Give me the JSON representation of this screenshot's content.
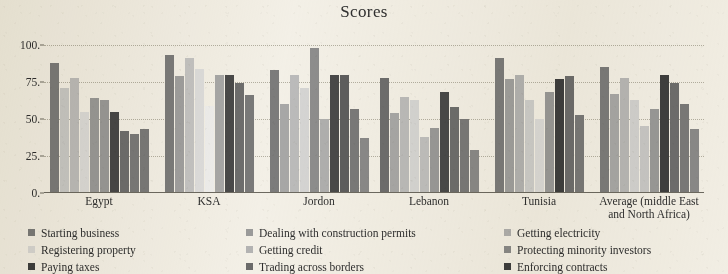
{
  "chart_data": {
    "type": "bar",
    "title": "Scores",
    "xlabel": "",
    "ylabel": "",
    "ylim": [
      0,
      100
    ],
    "yticks": [
      0,
      25,
      50,
      75,
      100
    ],
    "ytick_labels": [
      "0.",
      "25.",
      "50.",
      "75.",
      "100."
    ],
    "grid": true,
    "legend_position": "bottom",
    "legend_columns": 3,
    "categories": [
      "Egypt",
      "KSA",
      "Jordon",
      "Lebanon",
      "Tunisia",
      "Average (middle East and North Africa)"
    ],
    "category_label_lines": [
      [
        "Egypt"
      ],
      [
        "KSA"
      ],
      [
        "Jordon"
      ],
      [
        "Lebanon"
      ],
      [
        "Tunisia"
      ],
      [
        "Average (middle East",
        "and North Africa)"
      ]
    ],
    "series": [
      {
        "name": "Starting business",
        "color": "#7c7c7c",
        "values": [
          88,
          93,
          83,
          0,
          91,
          0
        ]
      },
      {
        "name": "Registering property",
        "color": "#c9c9c9",
        "values": [
          71,
          79,
          60,
          68,
          63,
          85
        ]
      },
      {
        "name": "Paying taxes",
        "color": "#3f3f3f",
        "values": [
          55,
          86,
          98,
          76,
          77,
          98
        ]
      },
      {
        "name": "Dealing with construction permits",
        "color": "#8f8f8f",
        "values": [
          78,
          80,
          71,
          73,
          0,
          68
        ]
      },
      {
        "name": "Getting credit",
        "color": "#d8d8d8",
        "values": [
          55,
          59,
          50,
          72,
          53,
          80
        ]
      },
      {
        "name": "Trading across borders",
        "color": "#6b6b6b",
        "values": [
          64,
          85,
          0,
          41,
          37,
          45
        ]
      },
      {
        "name": "Getting electricity",
        "color": "#a5a5a5",
        "values": [
          63,
          80,
          0,
          48,
          55,
          57
        ]
      },
      {
        "name": "Protecting minority investors",
        "color": "#5a5a5a",
        "values": [
          42,
          74,
          83,
          79,
          74,
          82
        ]
      },
      {
        "name": "Enforcing contracts",
        "color": "#707070",
        "values": [
          40,
          71,
          57,
          68,
          0,
          69
        ]
      }
    ],
    "groups": [
      {
        "category": "Egypt",
        "values": [
          88,
          71,
          78,
          55,
          64,
          63,
          55,
          42,
          40,
          43
        ]
      },
      {
        "category": "KSA",
        "values": [
          93,
          79,
          91,
          59,
          80,
          86,
          74,
          71
        ]
      },
      {
        "category": "Jordon",
        "values": [
          83,
          60,
          80,
          50,
          98,
          71,
          85,
          57,
          37
        ]
      },
      {
        "category": "Lebanon",
        "values": [
          91,
          68,
          73,
          72,
          41,
          48,
          76,
          68,
          57,
          29
        ]
      },
      {
        "category": "Tunisia",
        "values": [
          91,
          77,
          80,
          63,
          53,
          68,
          77,
          74,
          53
        ]
      },
      {
        "category": "Average (middle East and North Africa)",
        "values": [
          85,
          68,
          98,
          80,
          45,
          57,
          82,
          74,
          57
        ]
      }
    ],
    "bars_by_group": [
      {
        "category": "Egypt",
        "bars": [
          {
            "series": "Starting business",
            "value": 88,
            "color": "#7c7c7c"
          },
          {
            "series": "Registering property",
            "value": 71,
            "color": "#c9c9c9"
          },
          {
            "series": "Paying taxes",
            "value": 78,
            "color": "#bdbdbd"
          },
          {
            "series": "Dealing with construction permits",
            "value": 55,
            "color": "#dcdcdc"
          },
          {
            "series": "Getting credit",
            "value": 64,
            "color": "#9a9a9a"
          },
          {
            "series": "Trading across borders",
            "value": 63,
            "color": "#9a9a9a"
          },
          {
            "series": "Getting electricity",
            "value": 55,
            "color": "#484848"
          },
          {
            "series": "Protecting minority investors",
            "value": 42,
            "color": "#6e6e6e"
          },
          {
            "series": "Enforcing contracts",
            "value": 40,
            "color": "#7a7a7a"
          },
          {
            "series": "Enforcing contracts",
            "value": 43,
            "color": "#7a7a7a"
          }
        ]
      },
      {
        "category": "KSA",
        "bars": [
          {
            "series": "Starting business",
            "value": 93,
            "color": "#7c7c7c"
          },
          {
            "series": "Registering property",
            "value": 79,
            "color": "#a0a0a0"
          },
          {
            "series": "Paying taxes",
            "value": 91,
            "color": "#c4c4c4"
          },
          {
            "series": "Dealing with construction permits",
            "value": 84,
            "color": "#dedede"
          },
          {
            "series": "Getting credit",
            "value": 59,
            "color": "#efefef"
          },
          {
            "series": "Trading across borders",
            "value": 80,
            "color": "#a8a8a8"
          },
          {
            "series": "Getting electricity",
            "value": 80,
            "color": "#4a4a4a"
          },
          {
            "series": "Protecting minority investors",
            "value": 74,
            "color": "#6e6e6e"
          },
          {
            "series": "Enforcing contracts",
            "value": 66,
            "color": "#7a7a7a"
          }
        ]
      },
      {
        "category": "Jordon",
        "bars": [
          {
            "series": "Starting business",
            "value": 83,
            "color": "#7c7c7c"
          },
          {
            "series": "Registering property",
            "value": 60,
            "color": "#a8a8a8"
          },
          {
            "series": "Paying taxes",
            "value": 80,
            "color": "#bcbcbc"
          },
          {
            "series": "Dealing with construction permits",
            "value": 71,
            "color": "#d6d6d6"
          },
          {
            "series": "Getting credit",
            "value": 98,
            "color": "#8e8e8e"
          },
          {
            "series": "Trading across borders",
            "value": 50,
            "color": "#b0b0b0"
          },
          {
            "series": "Getting electricity",
            "value": 80,
            "color": "#4a4a4a"
          },
          {
            "series": "Protecting minority investors",
            "value": 80,
            "color": "#5e5e5e"
          },
          {
            "series": "Enforcing contracts",
            "value": 57,
            "color": "#7a7a7a"
          },
          {
            "series": "Enforcing contracts",
            "value": 37,
            "color": "#8a8a8a"
          }
        ]
      },
      {
        "category": "Lebanon",
        "bars": [
          {
            "series": "Starting business",
            "value": 78,
            "color": "#6e6e6e"
          },
          {
            "series": "Registering property",
            "value": 54,
            "color": "#a8a8a8"
          },
          {
            "series": "Paying taxes",
            "value": 65,
            "color": "#bcbcbc"
          },
          {
            "series": "Dealing with construction permits",
            "value": 63,
            "color": "#d6d6d6"
          },
          {
            "series": "Getting credit",
            "value": 38,
            "color": "#c0c0c0"
          },
          {
            "series": "Trading across borders",
            "value": 44,
            "color": "#9a9a9a"
          },
          {
            "series": "Getting electricity",
            "value": 68,
            "color": "#4a4a4a"
          },
          {
            "series": "Protecting minority investors",
            "value": 58,
            "color": "#6e6e6e"
          },
          {
            "series": "Enforcing contracts",
            "value": 50,
            "color": "#7a7a7a"
          },
          {
            "series": "Enforcing contracts",
            "value": 29,
            "color": "#8a8a8a"
          }
        ]
      },
      {
        "category": "Tunisia",
        "bars": [
          {
            "series": "Starting business",
            "value": 91,
            "color": "#7c7c7c"
          },
          {
            "series": "Registering property",
            "value": 77,
            "color": "#a0a0a0"
          },
          {
            "series": "Paying taxes",
            "value": 80,
            "color": "#b4b4b4"
          },
          {
            "series": "Dealing with construction permits",
            "value": 63,
            "color": "#cecece"
          },
          {
            "series": "Getting credit",
            "value": 50,
            "color": "#dcdcdc"
          },
          {
            "series": "Trading across borders",
            "value": 68,
            "color": "#9a9a9a"
          },
          {
            "series": "Getting electricity",
            "value": 77,
            "color": "#3f3f3f"
          },
          {
            "series": "Protecting minority investors",
            "value": 79,
            "color": "#6e6e6e"
          },
          {
            "series": "Enforcing contracts",
            "value": 53,
            "color": "#7a7a7a"
          }
        ]
      },
      {
        "category": "Average (middle East and North Africa)",
        "bars": [
          {
            "series": "Starting business",
            "value": 85,
            "color": "#7c7c7c"
          },
          {
            "series": "Registering property",
            "value": 67,
            "color": "#a8a8a8"
          },
          {
            "series": "Paying taxes",
            "value": 78,
            "color": "#b8b8b8"
          },
          {
            "series": "Dealing with construction permits",
            "value": 63,
            "color": "#d2d2d2"
          },
          {
            "series": "Getting credit",
            "value": 45,
            "color": "#c8c8c8"
          },
          {
            "series": "Trading across borders",
            "value": 57,
            "color": "#9a9a9a"
          },
          {
            "series": "Getting electricity",
            "value": 80,
            "color": "#3f3f3f"
          },
          {
            "series": "Protecting minority investors",
            "value": 74,
            "color": "#6e6e6e"
          },
          {
            "series": "Enforcing contracts",
            "value": 60,
            "color": "#7a7a7a"
          },
          {
            "series": "Enforcing contracts",
            "value": 43,
            "color": "#8a8a8a"
          }
        ]
      }
    ],
    "legend": [
      {
        "label": "Starting business",
        "color": "#7c7c7c"
      },
      {
        "label": "Dealing with construction permits",
        "color": "#9b9b9b"
      },
      {
        "label": "Getting electricity",
        "color": "#b0b0b0"
      },
      {
        "label": "Registering property",
        "color": "#d8d8d8"
      },
      {
        "label": "Getting credit",
        "color": "#b4b4b4"
      },
      {
        "label": "Protecting minority investors",
        "color": "#8a8a8a"
      },
      {
        "label": "Paying taxes",
        "color": "#3f3f3f"
      },
      {
        "label": "Trading across borders",
        "color": "#6b6b6b"
      },
      {
        "label": "Enforcing contracts",
        "color": "#3f3f3f"
      }
    ]
  }
}
